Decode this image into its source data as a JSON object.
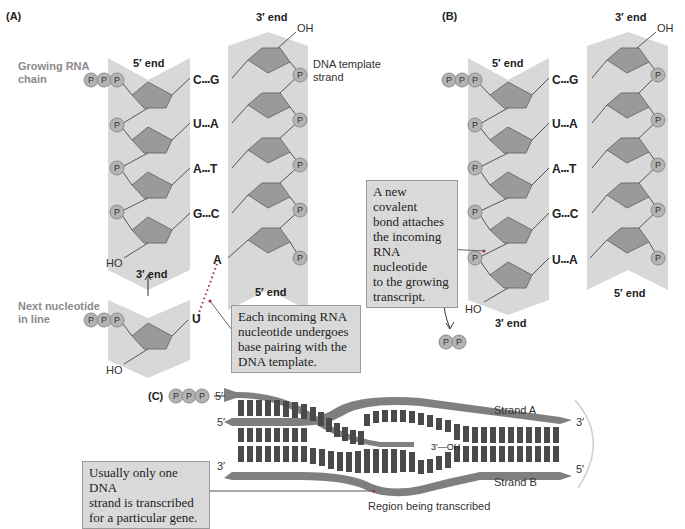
{
  "figure": {
    "panels": {
      "A": {
        "label": "(A)",
        "rna_strand": {
          "label": "Growing RNA chain",
          "label_lines": [
            "Growing RNA",
            "chain"
          ],
          "top_end": "5′ end",
          "bottom_end": "3′ end",
          "bottom_group": "HO",
          "triphosphate": [
            "P",
            "P",
            "P"
          ],
          "phosphates": [
            "P",
            "P",
            "P"
          ]
        },
        "dna_strand": {
          "label": "DNA template strand",
          "label_lines": [
            "DNA template",
            "strand"
          ],
          "top_end": "3′ end",
          "top_group": "OH",
          "bottom_end": "5′ end",
          "phosphates": [
            "P",
            "P",
            "P",
            "P",
            "P"
          ]
        },
        "base_pairs": [
          {
            "rna": "C",
            "dna": "G",
            "bond": "•••"
          },
          {
            "rna": "U",
            "dna": "A",
            "bond": "•••"
          },
          {
            "rna": "A",
            "dna": "T",
            "bond": "•••"
          },
          {
            "rna": "G",
            "dna": "C",
            "bond": "•••"
          }
        ],
        "unpaired_dna_base": "A",
        "next_nucleotide": {
          "label": "Next nucleotide in line",
          "label_lines": [
            "Next nucleotide",
            "in line"
          ],
          "base": "U",
          "group": "HO",
          "triphosphate": [
            "P",
            "P",
            "P"
          ]
        },
        "callout": "Each incoming RNA nucleotide undergoes base pairing with the DNA template.",
        "callout_lines": [
          "Each incoming RNA",
          "nucleotide undergoes",
          "base pairing with the",
          "DNA template."
        ]
      },
      "B": {
        "label": "(B)",
        "rna_strand": {
          "top_end": "5′ end",
          "bottom_end": "3′ end",
          "bottom_group": "HO",
          "triphosphate": [
            "P",
            "P",
            "P"
          ],
          "phosphates": [
            "P",
            "P",
            "P",
            "P"
          ]
        },
        "dna_strand": {
          "top_end": "3′ end",
          "top_group": "OH",
          "bottom_end": "5′ end",
          "phosphates": [
            "P",
            "P",
            "P",
            "P",
            "P"
          ]
        },
        "base_pairs": [
          {
            "rna": "C",
            "dna": "G",
            "bond": "•••"
          },
          {
            "rna": "U",
            "dna": "A",
            "bond": "•••"
          },
          {
            "rna": "A",
            "dna": "T",
            "bond": "•••"
          },
          {
            "rna": "G",
            "dna": "C",
            "bond": "•••"
          },
          {
            "rna": "U",
            "dna": "A",
            "bond": "•••"
          }
        ],
        "released_pyrophosphate": [
          "P",
          "P"
        ],
        "callout": "A new covalent bond attaches the incoming RNA nucleotide to the growing transcript.",
        "callout_lines": [
          "A new covalent",
          "bond attaches",
          "the incoming",
          "RNA nucleotide",
          "to the growing",
          "transcript."
        ]
      },
      "C": {
        "label": "(C)",
        "rna_triphosphate": [
          "P",
          "P",
          "P"
        ],
        "rna_5prime": "5′",
        "rna_3prime_end": "3′—OH",
        "strand_a": {
          "label": "Strand A",
          "left_end": "5′",
          "right_end": "3′"
        },
        "strand_b": {
          "label": "Strand B",
          "left_end": "3′",
          "right_end": "5′"
        },
        "region_label": "Region being transcribed",
        "callout": "Usually only one DNA strand is transcribed for a particular gene.",
        "callout_lines": [
          "Usually only one DNA",
          "strand is transcribed",
          "for a particular gene."
        ]
      }
    },
    "colors": {
      "backbone_band": "#d8d8d8",
      "sugar_fill": "#9a9a9a",
      "sugar_stroke": "#6e6e6e",
      "phosphate_fill": "#b3b3b3",
      "strand_c": "#7f7f7f",
      "rungs_c": "#4a4a4a",
      "callout_bg": "#d9d9d9",
      "dot_red": "#9b3b3b"
    }
  }
}
